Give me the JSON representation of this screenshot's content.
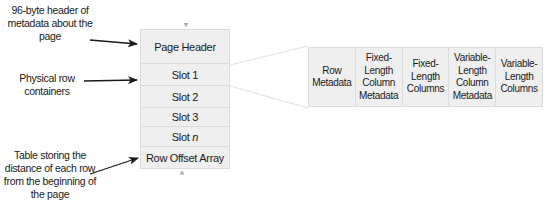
{
  "annotations": {
    "header_label": "96-byte header of metadata about the page",
    "rows_label": "Physical row containers",
    "offset_label": "Table storing the distance of each row from the beginning of the page"
  },
  "page": {
    "cells": [
      {
        "label": "Page Header"
      },
      {
        "label": "Slot 1"
      },
      {
        "label": "Slot 2"
      },
      {
        "label": "Slot 3"
      },
      {
        "label_prefix": "Slot ",
        "label_italic": "n"
      },
      {
        "label": "Row Offset Array"
      }
    ]
  },
  "row_structure": {
    "cells": [
      {
        "label": "Row\nMetadata"
      },
      {
        "label": "Fixed-\nLength\nColumn\nMetadata"
      },
      {
        "label": "Fixed-\nLength\nColumns"
      },
      {
        "label": "Variable-\nLength\nColumn\nMetadata"
      },
      {
        "label": "Variable-\nLength\nColumns"
      }
    ]
  },
  "colors": {
    "cell_fill": "#efefef",
    "cell_border": "#dcdcdc",
    "arrow": "#1a1a1a",
    "connector": "#e2e2e2",
    "marker": "#aaaaaa"
  }
}
